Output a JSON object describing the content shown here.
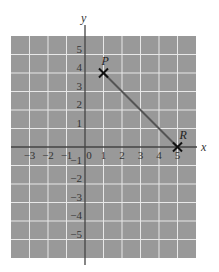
{
  "chart_data": {
    "type": "line",
    "title": "",
    "xlabel": "x",
    "ylabel": "y",
    "xlim": [
      -4,
      6
    ],
    "ylim": [
      -6,
      6
    ],
    "grid": true,
    "x_tick_labels": [
      "−3",
      "−2",
      "−1",
      "0",
      "1",
      "2",
      "3",
      "4",
      "5"
    ],
    "y_tick_labels": [
      "5",
      "4",
      "3",
      "2",
      "1",
      "−1",
      "−2",
      "−3",
      "−4",
      "−5"
    ],
    "points": [
      {
        "label": "P",
        "x": 1,
        "y": 4
      },
      {
        "label": "R",
        "x": 5,
        "y": 0
      }
    ],
    "segments": [
      {
        "from": "P",
        "to": "R"
      }
    ]
  },
  "colors": {
    "grid_background": "#999999",
    "grid_lines": "#e8e8e8",
    "axis": "#444444",
    "segment": "#555555",
    "marker": "#111111"
  }
}
